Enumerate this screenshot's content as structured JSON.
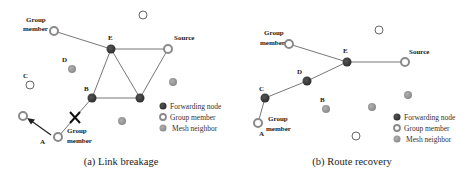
{
  "colors": {
    "forwarding": "#3a3a3a",
    "mesh": "#9a9a9a",
    "group_ring": "#8a8a8a",
    "edge": "#777777"
  },
  "legend": {
    "forwarding_node": "Forwarding node",
    "group_member": "Group member",
    "mesh_neighbor": "Mesh neighbor"
  },
  "panel_a": {
    "caption": "(a) Link breakage",
    "labels": {
      "group_member_top_line1": "Group",
      "group_member_top_line2": "member",
      "E": "E",
      "source": "Source",
      "D": "D",
      "C": "C",
      "B": "B",
      "A": "A",
      "group_member_bottom_line1": "Group",
      "group_member_bottom_line2": "member"
    }
  },
  "panel_b": {
    "caption": "(b) Route recovery",
    "labels": {
      "group_member_top_line1": "Group",
      "group_member_top_line2": "member",
      "E": "E",
      "source": "Source",
      "D": "D",
      "C": "C",
      "B": "B",
      "A": "A",
      "group_member_bottom_line1": "Group",
      "group_member_bottom_line2": "member"
    }
  }
}
